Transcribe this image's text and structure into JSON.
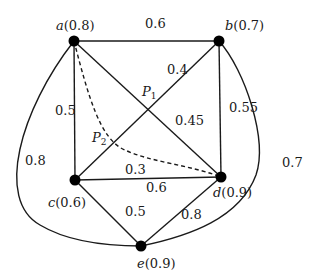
{
  "diagram": {
    "type": "weighted-graph",
    "nodes": [
      {
        "id": "a",
        "value": "0.8",
        "label": "a(0.8)"
      },
      {
        "id": "b",
        "value": "0.7",
        "label": "b(0.7)"
      },
      {
        "id": "c",
        "value": "0.6",
        "label": "c(0.6)"
      },
      {
        "id": "d",
        "value": "0.9",
        "label": "d(0.9)"
      },
      {
        "id": "e",
        "value": "0.9",
        "label": "e(0.9)"
      }
    ],
    "edges": [
      {
        "from": "a",
        "to": "b",
        "weight": "0.6"
      },
      {
        "from": "a",
        "to": "c",
        "weight": "0.5"
      },
      {
        "from": "a",
        "to": "d",
        "weight": "0.45"
      },
      {
        "from": "b",
        "to": "c",
        "weight": "0.4"
      },
      {
        "from": "b",
        "to": "d",
        "weight": "0.55"
      },
      {
        "from": "c",
        "to": "d",
        "weight_above": "0.3",
        "weight_below": "0.6"
      },
      {
        "from": "c",
        "to": "e",
        "weight": "0.5"
      },
      {
        "from": "d",
        "to": "e",
        "weight": "0.8"
      },
      {
        "from": "a",
        "to": "e",
        "weight": "0.8",
        "curved": true
      },
      {
        "from": "b",
        "to": "e",
        "weight": "0.7",
        "curved": true
      },
      {
        "from": "a",
        "to": "d",
        "dashed": true,
        "curved": true
      }
    ],
    "points": [
      {
        "id": "P1",
        "main": "P",
        "sub": "1"
      },
      {
        "id": "P2",
        "main": "P",
        "sub": "2"
      }
    ],
    "labels": {
      "ab": "0.6",
      "ac": "0.5",
      "ad": "0.45",
      "bc": "0.4",
      "bd": "0.55",
      "cd_top": "0.3",
      "cd_bottom": "0.6",
      "ce": "0.5",
      "de": "0.8",
      "ae_curve": "0.8",
      "be_curve": "0.7"
    },
    "node_names": {
      "a": "a",
      "b": "b",
      "c": "c",
      "d": "d",
      "e": "e"
    },
    "node_values": {
      "a": "(0.8)",
      "b": "(0.7)",
      "c": "(0.6)",
      "d": "(0.9)",
      "e": "(0.9)"
    }
  }
}
